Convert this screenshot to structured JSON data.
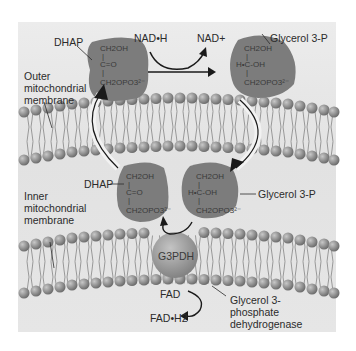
{
  "diagram": {
    "labels": {
      "dhap_top": "DHAP",
      "dhap_bottom": "DHAP",
      "nadh": "NAD•H",
      "nad_plus": "NAD+",
      "g3p_top": "Glycerol 3-P",
      "g3p_bottom": "Glycerol 3-P",
      "outer_membrane_1": "Outer",
      "outer_membrane_2": "mitochondrial",
      "outer_membrane_3": "membrane",
      "inner_membrane_1": "Inner",
      "inner_membrane_2": "mitochondrial",
      "inner_membrane_3": "membrane",
      "enzyme": "G3PDH",
      "fad": "FAD",
      "fadh2": "FAD•H2",
      "enzyme_name_1": "Glycerol 3-",
      "enzyme_name_2": "phosphate",
      "enzyme_name_3": "dehydrogenase"
    },
    "dhap_structure": [
      "CH2OH",
      "|",
      "C=O",
      "|",
      "CH2OPO3²⁻"
    ],
    "g3p_structure": [
      "CH2OH",
      "|",
      "H•C-OH",
      "|",
      "CH2OPO3²⁻"
    ],
    "colors": {
      "background": "#e6e6e6",
      "molecule_blob": "#7c7c7c",
      "lipid_head": "#8e8e8e",
      "enzyme": "#9a9a9a",
      "arrow": "#1a1a1a"
    }
  }
}
